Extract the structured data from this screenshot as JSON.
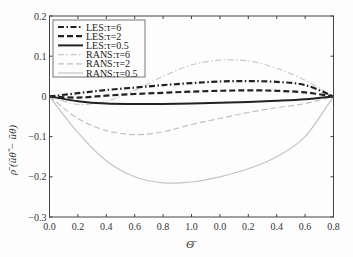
{
  "chart_data": {
    "type": "line",
    "title": "",
    "xlabel": "Θ̄",
    "ylabel": "ρ̄ (ũθ̃ − ũθ)",
    "x_tick_labels": [
      "0.0",
      "0.2",
      "0.4",
      "0.6",
      "0.8",
      "1.0",
      "0.0",
      "0.2",
      "0.4",
      "0.6",
      "0.8"
    ],
    "y_ticks": [
      0.2,
      0.1,
      0,
      -0.1,
      -0.2,
      -0.3
    ],
    "y_tick_labels": [
      "0.2",
      "0.1",
      "0",
      "−0.1",
      "−0.2",
      "−0.3"
    ],
    "ylim": [
      -0.3,
      0.2
    ],
    "grid": false,
    "legend_position": "upper left",
    "x": [
      0,
      1,
      2,
      3,
      4,
      5,
      6,
      7,
      8,
      9,
      10
    ],
    "series": [
      {
        "name": "LES:τ=6",
        "color": "#222222",
        "style": "dashdot",
        "width": 2.2,
        "values": [
          0,
          0.008,
          0.016,
          0.022,
          0.028,
          0.033,
          0.037,
          0.038,
          0.036,
          0.028,
          0
        ]
      },
      {
        "name": "LES:τ=2",
        "color": "#222222",
        "style": "dashed",
        "width": 2.2,
        "values": [
          0,
          -0.003,
          0.002,
          0.006,
          0.009,
          0.012,
          0.014,
          0.015,
          0.014,
          0.01,
          0
        ]
      },
      {
        "name": "LES:τ=0.5",
        "color": "#222222",
        "style": "solid",
        "width": 2.0,
        "values": [
          0,
          -0.012,
          -0.018,
          -0.019,
          -0.019,
          -0.018,
          -0.016,
          -0.014,
          -0.011,
          -0.007,
          0
        ]
      },
      {
        "name": "RANS:τ=6",
        "color": "#c8c8c8",
        "style": "dashdot",
        "width": 1.2,
        "values": [
          0,
          -0.02,
          -0.012,
          0.015,
          0.05,
          0.078,
          0.09,
          0.088,
          0.07,
          0.04,
          0
        ]
      },
      {
        "name": "RANS:τ=2",
        "color": "#c0c0c0",
        "style": "dashed",
        "width": 1.2,
        "values": [
          0,
          -0.055,
          -0.085,
          -0.095,
          -0.088,
          -0.07,
          -0.055,
          -0.04,
          -0.028,
          -0.018,
          0
        ]
      },
      {
        "name": "RANS:τ=0.5",
        "color": "#c4c4c4",
        "style": "solid",
        "width": 1.2,
        "values": [
          0,
          -0.09,
          -0.16,
          -0.2,
          -0.215,
          -0.213,
          -0.2,
          -0.18,
          -0.15,
          -0.1,
          0
        ]
      }
    ]
  }
}
